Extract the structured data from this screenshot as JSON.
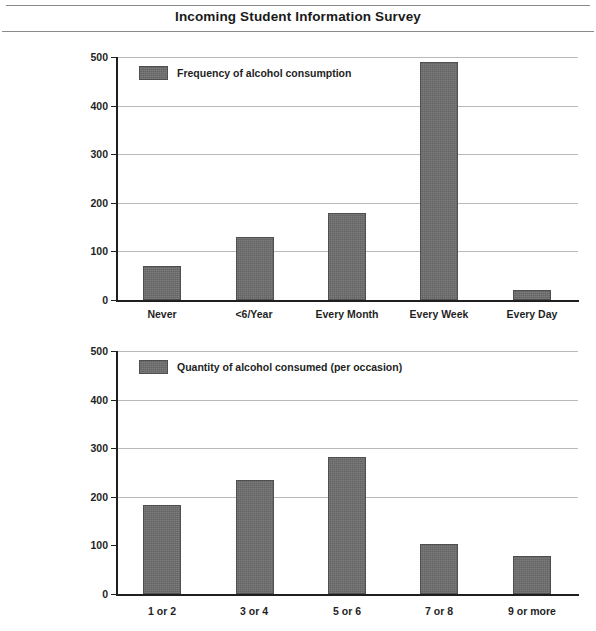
{
  "header": {
    "title": "Incoming Student Information Survey"
  },
  "chart_data": [
    {
      "type": "bar",
      "id": "frequency",
      "title": "",
      "xlabel": "",
      "ylabel": "",
      "ylim": [
        0,
        500
      ],
      "yticks": [
        0,
        100,
        200,
        300,
        400,
        500
      ],
      "grid": true,
      "legend_position": "top-left",
      "legend": [
        "Frequency of alcohol consumption"
      ],
      "categories": [
        "Never",
        "<6/Year",
        "Every Month",
        "Every Week",
        "Every Day"
      ],
      "values": [
        70,
        130,
        180,
        490,
        20
      ]
    },
    {
      "type": "bar",
      "id": "quantity",
      "title": "",
      "xlabel": "",
      "ylabel": "",
      "ylim": [
        0,
        500
      ],
      "yticks": [
        0,
        100,
        200,
        300,
        400,
        500
      ],
      "grid": true,
      "legend_position": "top-left",
      "legend": [
        "Quantity of alcohol consumed (per occasion)"
      ],
      "categories": [
        "1 or 2",
        "3 or 4",
        "5 or 6",
        "7 or 8",
        "9 or more"
      ],
      "values": [
        183,
        235,
        282,
        102,
        78
      ]
    }
  ],
  "style": {
    "bar_fill": "#6e6e6e",
    "bar_stroke": "#4f4f4f",
    "axis_color": "#1f1f1f",
    "grid_color": "#b9b9b9",
    "text_color": "#1a1a1a",
    "background": "#ffffff"
  }
}
